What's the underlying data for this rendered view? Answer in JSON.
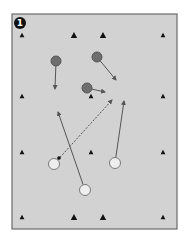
{
  "diagram": {
    "step_badge": "1",
    "colors": {
      "field": "#d2d2d2",
      "field_border": "#6a6a6a",
      "cone": "#111111",
      "team_dark": "#6e6e6e",
      "team_dark_stroke": "#555555",
      "team_light": "#eeeeee",
      "team_light_stroke": "#7a7a7a",
      "run_line": "#555555",
      "pass_line": "#555555",
      "ball": "#111111",
      "badge": "#111111"
    },
    "cones": [
      {
        "row": "top",
        "col": 1
      },
      {
        "row": "top",
        "col": 2
      },
      {
        "row": "top",
        "col": 3
      },
      {
        "row": "top",
        "col": 4
      },
      {
        "row": "upper-middle",
        "col": 1
      },
      {
        "row": "upper-middle",
        "col": 2
      },
      {
        "row": "upper-middle",
        "col": 3
      },
      {
        "row": "lower-middle",
        "col": 1
      },
      {
        "row": "lower-middle",
        "col": 2
      },
      {
        "row": "lower-middle",
        "col": 3
      },
      {
        "row": "bottom",
        "col": 1
      },
      {
        "row": "bottom",
        "col": 2
      },
      {
        "row": "bottom",
        "col": 3
      },
      {
        "row": "bottom",
        "col": 4
      }
    ],
    "players": [
      {
        "team": "dark",
        "id": "d1"
      },
      {
        "team": "dark",
        "id": "d2"
      },
      {
        "team": "dark",
        "id": "d3"
      },
      {
        "team": "light",
        "id": "l1",
        "has_ball": true
      },
      {
        "team": "light",
        "id": "l2"
      },
      {
        "team": "light",
        "id": "l3"
      }
    ],
    "movements": [
      {
        "type": "run",
        "from": "d1"
      },
      {
        "type": "run",
        "from": "d2"
      },
      {
        "type": "run",
        "from": "d3"
      },
      {
        "type": "pass",
        "from": "l1"
      },
      {
        "type": "run",
        "from": "l2"
      },
      {
        "type": "run",
        "from": "l3"
      }
    ]
  }
}
